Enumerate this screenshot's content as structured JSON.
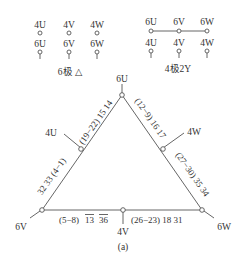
{
  "legend": {
    "delta": {
      "top_row": [
        "4U",
        "4V",
        "4W"
      ],
      "bottom_row": [
        "6U",
        "6V",
        "6W"
      ],
      "caption": "6极 △"
    },
    "wye": {
      "top_row": [
        "6U",
        "6V",
        "6W"
      ],
      "bottom_row": [
        "4U",
        "4V",
        "4W"
      ],
      "caption": "4极2Y"
    }
  },
  "triangle": {
    "vertices": {
      "top": "6U",
      "left": "6V",
      "right": "6W"
    },
    "midpoints": {
      "left": "4U",
      "right": "4W",
      "bottom": "4V"
    },
    "edges": {
      "left_upper": "(19−22) 15 14",
      "left_lower": "32 33 (4−1)",
      "right_upper": "(12−9) 16 17",
      "right_lower": "(27−30) 35 34",
      "bottom_left_prefix": "(5−8)",
      "bottom_left_a": "13",
      "bottom_left_b": "36",
      "bottom_right": "(26−23) 18 31"
    }
  },
  "caption": "(a)"
}
